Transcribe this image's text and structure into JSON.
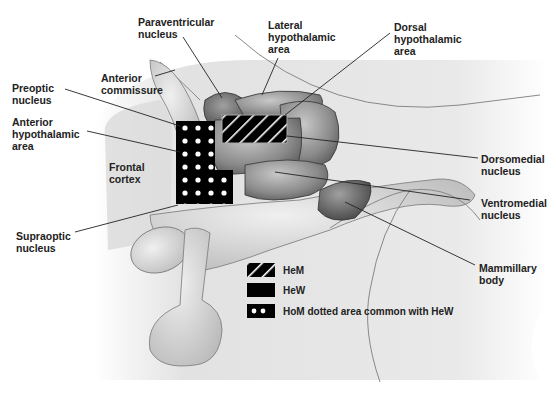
{
  "diagram": {
    "type": "anatomical-diagram",
    "labels": {
      "paraventricular": [
        "Paraventricular",
        "nucleus"
      ],
      "lateral": [
        "Lateral",
        "hypothalamic",
        "area"
      ],
      "dorsal": [
        "Dorsal",
        "hypothalamic",
        "area"
      ],
      "anterior_commissure": [
        "Anterior",
        "commissure"
      ],
      "preoptic": [
        "Preoptic",
        "nucleus"
      ],
      "anterior_hypothalamic": [
        "Anterior",
        "hypothalamic",
        "area"
      ],
      "frontal_cortex": [
        "Frontal",
        "cortex"
      ],
      "dorsomedial": [
        "Dorsomedial",
        "nucleus"
      ],
      "ventromedial": [
        "Ventromedial",
        "nucleus"
      ],
      "supraoptic": [
        "Supraoptic",
        "nucleus"
      ],
      "mammillary": [
        "Mammillary",
        "body"
      ]
    },
    "legend": [
      {
        "swatch": "hatched",
        "label": "HeM"
      },
      {
        "swatch": "solid-black",
        "label": "HeW"
      },
      {
        "swatch": "dotted-black",
        "label": "HoM dotted area common with HeW"
      }
    ],
    "colors": {
      "highlight": "#000000",
      "hatch_line": "#ffffff",
      "tissue_dark": "#6e6e6e",
      "tissue_mid": "#9a9a9a",
      "tissue_light": "#d4d4d4",
      "background_shade": "#e6e6e6",
      "label_text": "#222222"
    }
  }
}
